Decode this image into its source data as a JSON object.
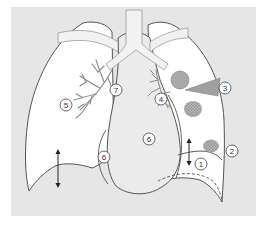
{
  "diagram": {
    "title": "",
    "colors": {
      "page_background": "#ffffff",
      "panel_background": "#e6e6e6",
      "lung_fill": "#ffffff",
      "outline": "#555555",
      "mediastinum_fill": "#ebebeb",
      "bronchi": "#8a8a8a",
      "round_lesion": "#a9a9a9",
      "triangle_lesion": "#a0a0a0",
      "speckled_lesion": "#9a9a9a",
      "label_circle_stroke": "#444444",
      "label_text": "#333333"
    },
    "labels": [
      {
        "id": "1",
        "text": "1",
        "region": "left-diaphragm"
      },
      {
        "id": "2",
        "text": "2",
        "region": "left-costophrenic-angle"
      },
      {
        "id": "3",
        "text": "3",
        "region": "left-lateral-pleural-wedge"
      },
      {
        "id": "4",
        "text": "4",
        "region": "left-hilum-bronchi"
      },
      {
        "id": "5",
        "text": "5",
        "region": "right-hilum-bronchi"
      },
      {
        "id": "6a",
        "text": "6",
        "region": "right-heart-border"
      },
      {
        "id": "6b",
        "text": "6",
        "region": "left-heart-border"
      },
      {
        "id": "7",
        "text": "7",
        "region": "trachea-mediastinum"
      }
    ],
    "arrows": [
      {
        "name": "right-diaphragm-motion",
        "direction": "up-down"
      },
      {
        "name": "left-diaphragm-motion",
        "direction": "up-down"
      }
    ],
    "lesions": [
      {
        "name": "round-opacity",
        "shape": "circle"
      },
      {
        "name": "pleural-wedge",
        "shape": "triangle"
      },
      {
        "name": "speckled-opacity-upper",
        "shape": "speckled-ellipse"
      },
      {
        "name": "speckled-opacity-lower",
        "shape": "speckled-ellipse"
      }
    ]
  }
}
